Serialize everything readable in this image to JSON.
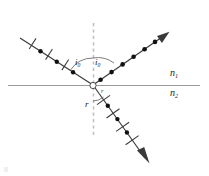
{
  "figure": {
    "kind": "optics-ray-diagram",
    "background_color": "#ffffff",
    "width": 209,
    "height": 176
  },
  "colors": {
    "ray": "#3a3a3a",
    "interface_line": "#9a9a9a",
    "normal_line": "#bdbdbd",
    "marker": "#111111",
    "label": "#1a1a1a"
  },
  "labels": {
    "angle_incidence": "i",
    "angle_incidence_sub": "0",
    "angle_reflection": "i",
    "angle_reflection_sub": "0",
    "angle_refraction": "r",
    "index_upper": "n",
    "index_upper_sub": "1",
    "index_lower": "n",
    "index_lower_sub": "2",
    "origin_tick": "r"
  },
  "geometry": {
    "interface": {
      "x1": 8,
      "y1": 85,
      "x2": 200,
      "y2": 85
    },
    "normal": {
      "x1": 93,
      "y1": 23,
      "x2": 93,
      "y2": 137
    },
    "origin": {
      "x": 93,
      "y": 85
    },
    "incident_ray": {
      "x1": 20,
      "y1": 38,
      "x2": 93,
      "y2": 85
    },
    "reflected_ray": {
      "x1": 93,
      "y1": 85,
      "x2": 168,
      "y2": 33
    },
    "refracted_ray": {
      "x1": 93,
      "y1": 85,
      "x2": 148,
      "y2": 162
    }
  },
  "rays": [
    {
      "name": "incident-ray",
      "polarization_markers": "dots-and-ticks",
      "arrowhead": false,
      "dots": 3,
      "ticks": 3
    },
    {
      "name": "reflected-ray",
      "polarization_markers": "dots-only",
      "arrowhead": true,
      "dots": 6,
      "ticks": 0
    },
    {
      "name": "refracted-ray",
      "polarization_markers": "dots-and-ticks",
      "arrowhead": true,
      "dots": 3,
      "ticks": 4
    }
  ]
}
